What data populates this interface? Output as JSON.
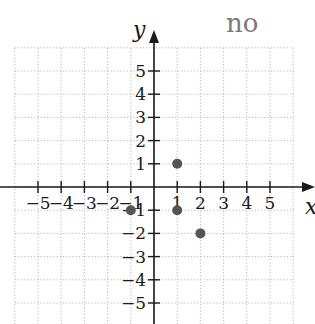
{
  "answer_label": "no",
  "colors": {
    "axis": "#1a1a1a",
    "grid": "#b8b8b8",
    "point": "#555555",
    "text": "#1a1a1a",
    "answer": "#7a7a7a"
  },
  "axes": {
    "x_label": "x",
    "y_label": "y",
    "x_ticks": [
      -5,
      -4,
      -3,
      -2,
      -1,
      1,
      2,
      3,
      4,
      5
    ],
    "y_ticks": [
      5,
      4,
      3,
      2,
      1,
      -1,
      -2,
      -3,
      -4,
      -5
    ],
    "x_tick_labels": [
      "−5",
      "−4",
      "−3",
      "−2",
      "−1",
      "1",
      "2",
      "3",
      "4",
      "5"
    ],
    "y_tick_labels": [
      "5",
      "4",
      "3",
      "2",
      "1",
      "−1",
      "−2",
      "−3",
      "−4",
      "−5"
    ]
  },
  "chart_data": {
    "type": "scatter",
    "title": "",
    "xlabel": "x",
    "ylabel": "y",
    "xlim": [
      -6,
      6
    ],
    "ylim": [
      -6,
      6
    ],
    "grid": true,
    "points": [
      {
        "x": 1,
        "y": 1
      },
      {
        "x": -1,
        "y": -1
      },
      {
        "x": 1,
        "y": -1
      },
      {
        "x": 2,
        "y": -2
      }
    ]
  }
}
